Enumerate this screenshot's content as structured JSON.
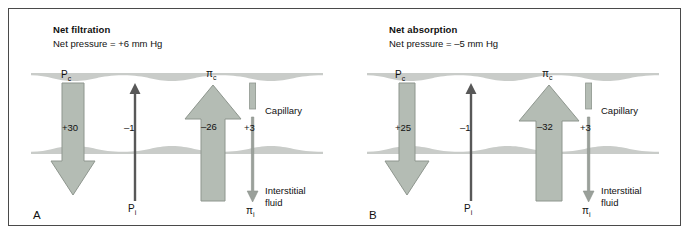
{
  "figure": {
    "type": "capillary-starling-forces-diagram",
    "colors": {
      "arrow_fill": "#b4bcb4",
      "arrow_stroke": "#8e968e",
      "membrane": "#c9ccc9",
      "border": "#4a4a4a",
      "text": "#111111",
      "background": "#ffffff"
    }
  },
  "panels": [
    {
      "letter": "A",
      "title": "Net filtration",
      "subtitle": "Net pressure = +6 mm Hg",
      "capillary_label": "Capillary",
      "interstitial_label_line1": "Interstitial",
      "interstitial_label_line2": "fluid",
      "forces": [
        {
          "id": "pc",
          "symbol": "P",
          "subscript": "c",
          "value": "+30",
          "direction": "down",
          "style": "wide",
          "label_position": "top",
          "name": "capillary-hydrostatic-pressure"
        },
        {
          "id": "pi",
          "symbol": "P",
          "subscript": "i",
          "value": "–1",
          "direction": "up",
          "style": "thin",
          "label_position": "bottom",
          "name": "interstitial-hydrostatic-pressure"
        },
        {
          "id": "pic",
          "symbol": "π",
          "subscript": "c",
          "value": "–26",
          "direction": "up",
          "style": "wide",
          "label_position": "top",
          "name": "capillary-oncotic-pressure"
        },
        {
          "id": "pii",
          "symbol": "π",
          "subscript": "i",
          "value": "+3",
          "direction": "down",
          "style": "thin",
          "label_position": "bottom",
          "name": "interstitial-oncotic-pressure"
        }
      ]
    },
    {
      "letter": "B",
      "title": "Net absorption",
      "subtitle": "Net pressure = –5 mm Hg",
      "capillary_label": "Capillary",
      "interstitial_label_line1": "Interstitial",
      "interstitial_label_line2": "fluid",
      "forces": [
        {
          "id": "pc",
          "symbol": "P",
          "subscript": "c",
          "value": "+25",
          "direction": "down",
          "style": "wide",
          "label_position": "top",
          "name": "capillary-hydrostatic-pressure"
        },
        {
          "id": "pi",
          "symbol": "P",
          "subscript": "i",
          "value": "–1",
          "direction": "up",
          "style": "thin",
          "label_position": "bottom",
          "name": "interstitial-hydrostatic-pressure"
        },
        {
          "id": "pic",
          "symbol": "π",
          "subscript": "c",
          "value": "–32",
          "direction": "up",
          "style": "wide",
          "label_position": "top",
          "name": "capillary-oncotic-pressure"
        },
        {
          "id": "pii",
          "symbol": "π",
          "subscript": "i",
          "value": "+3",
          "direction": "down",
          "style": "thin",
          "label_position": "bottom",
          "name": "interstitial-oncotic-pressure"
        }
      ]
    }
  ]
}
